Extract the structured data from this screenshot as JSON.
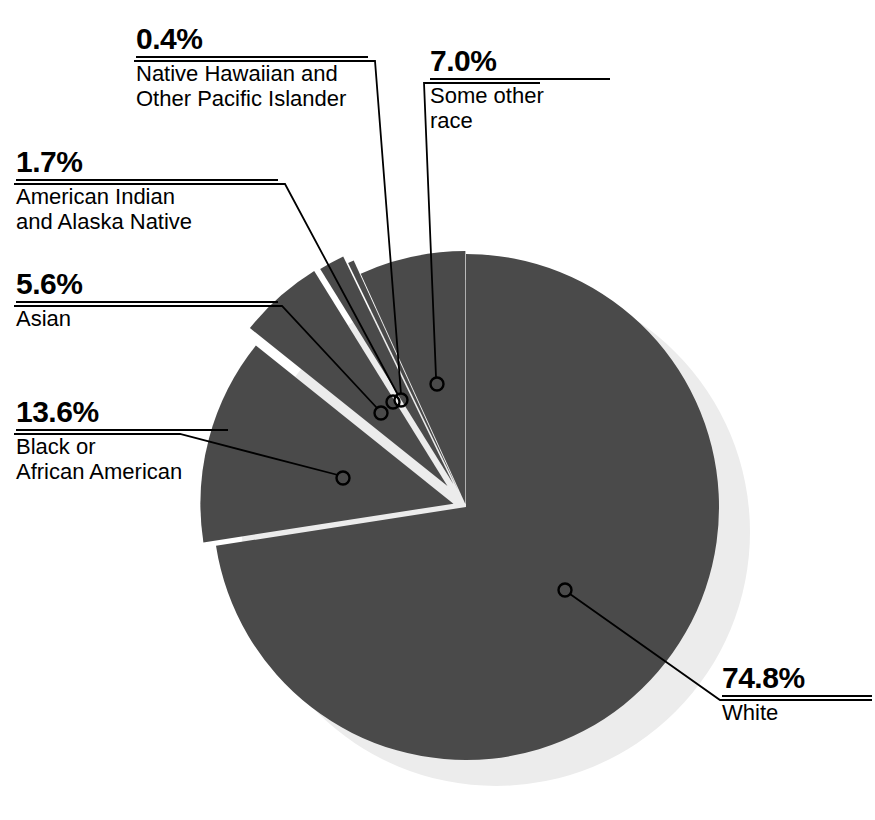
{
  "chart_data": {
    "type": "pie",
    "title": "",
    "subtitle": "",
    "legend_position": "callouts",
    "grid": false,
    "unit": "percent",
    "total": 103.1,
    "categories": [
      "White",
      "Black or African American",
      "Asian",
      "American Indian and Alaska Native",
      "Native Hawaiian and Other Pacific Islander",
      "Some other race"
    ],
    "values": [
      74.8,
      13.6,
      5.6,
      1.7,
      0.4,
      7.0
    ],
    "labels": [
      "74.8%",
      "13.6%",
      "5.6%",
      "1.7%",
      "0.4%",
      "7.0%"
    ],
    "slice_color": "#4a4a4a",
    "shadow_color": "#ececec",
    "leader_color": "#000000",
    "background": "#ffffff"
  },
  "callouts": [
    {
      "id": "native-hawaiian",
      "pct": "0.4%",
      "name": "Native Hawaiian and\nOther Pacific Islander"
    },
    {
      "id": "some-other-race",
      "pct": "7.0%",
      "name": "Some other\nrace"
    },
    {
      "id": "american-indian",
      "pct": "1.7%",
      "name": "American Indian\nand Alaska Native"
    },
    {
      "id": "asian",
      "pct": "5.6%",
      "name": "Asian"
    },
    {
      "id": "black-african-american",
      "pct": "13.6%",
      "name": "Black or\nAfrican American"
    },
    {
      "id": "white",
      "pct": "74.8%",
      "name": "White"
    }
  ]
}
